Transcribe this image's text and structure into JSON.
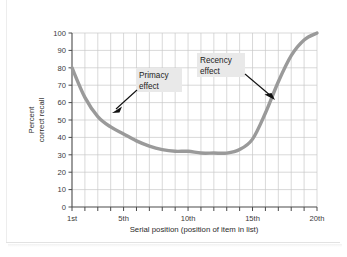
{
  "chart_data": {
    "type": "line",
    "title": "",
    "xlabel": "Serial position (position of item in list)",
    "ylabel": "Percent correct recall",
    "ylabel_line1": "Percent",
    "ylabel_line2": "correct recall",
    "xlim": [
      1,
      20
    ],
    "ylim": [
      0,
      100
    ],
    "grid": true,
    "legend": "none",
    "y_ticks": [
      0,
      10,
      20,
      30,
      40,
      50,
      60,
      70,
      80,
      90,
      100
    ],
    "y_tick_labels": [
      "0",
      "10",
      "20",
      "30",
      "40",
      "50",
      "60",
      "70",
      "80",
      "90",
      "100"
    ],
    "x_ticks": [
      1,
      5,
      10,
      15,
      20
    ],
    "x_tick_labels": [
      "1st",
      "5th",
      "10th",
      "15th",
      "20th"
    ],
    "x_minor_ticks": [
      1,
      2,
      3,
      4,
      5,
      6,
      7,
      8,
      9,
      10,
      11,
      12,
      13,
      14,
      15,
      16,
      17,
      18,
      19,
      20
    ],
    "series": [
      {
        "name": "Serial position curve",
        "color": "#9a9a9a",
        "x": [
          1,
          2,
          3,
          4,
          5,
          6,
          7,
          8,
          9,
          10,
          11,
          12,
          13,
          14,
          15,
          16,
          17,
          18,
          19,
          20
        ],
        "values": [
          80,
          63,
          52,
          46,
          42,
          38,
          35,
          33,
          32,
          32,
          31,
          31,
          31,
          33,
          39,
          54,
          72,
          87,
          96,
          100
        ]
      }
    ],
    "annotations": [
      {
        "id": "primacy",
        "label_line1": "Primacy",
        "label_line2": "effect",
        "target_x": 3.1,
        "target_y": 51,
        "background": "#e9e9e9"
      },
      {
        "id": "recency",
        "label_line1": "Recency",
        "label_line2": "effect",
        "target_x": 16.3,
        "target_y": 63,
        "background": "#e9e9e9"
      }
    ],
    "colors": {
      "curve": "#9a9a9a",
      "grid": "#c9c9c9",
      "axis": "#4a4a4a",
      "arrow": "#111111",
      "text": "#2b2b2b",
      "background": "#ffffff"
    }
  }
}
